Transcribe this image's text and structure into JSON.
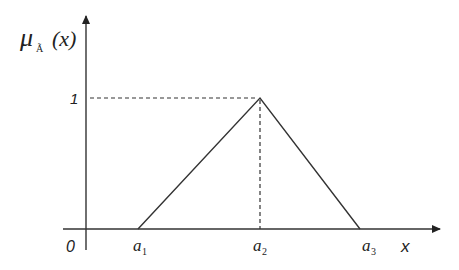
{
  "diagram": {
    "type": "triangular-membership-function",
    "y_axis_label": {
      "symbol": "μ",
      "subscript": "Ã",
      "argument": "(x)"
    },
    "x_axis_label": "x",
    "origin_label": "0",
    "peak_value_label": "1",
    "points": [
      {
        "name": "a",
        "sub": "1"
      },
      {
        "name": "a",
        "sub": "2"
      },
      {
        "name": "a",
        "sub": "3"
      }
    ],
    "colors": {
      "line": "#333333",
      "text": "#222222"
    }
  }
}
